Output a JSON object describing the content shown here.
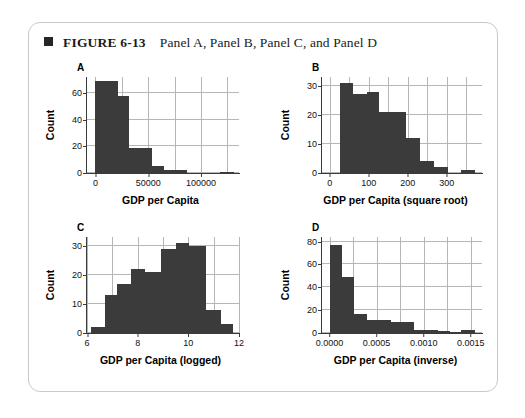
{
  "figure": {
    "bullet_icon": "square-bullet-icon",
    "label": "FIGURE 6-13",
    "caption": "Panel A, Panel B, Panel C, and Panel D"
  },
  "colors": {
    "bar": "#3b3b3b",
    "grid": "#b6b6b6",
    "axis": "#3a3a3a",
    "card_border": "#c9c9c9",
    "text": "#111111"
  },
  "chart_data": [
    {
      "panel": "A",
      "type": "bar",
      "title": "A",
      "xlabel": "GDP per Capita",
      "ylabel": "Count",
      "xlim": [
        -8000,
        136000
      ],
      "ylim": [
        0,
        72
      ],
      "xticks": [
        0,
        50000,
        100000
      ],
      "xticklabels": [
        "0",
        "50000",
        "100000"
      ],
      "yticks": [
        0,
        20,
        40,
        60
      ],
      "yticklabels": [
        "0",
        "20",
        "40",
        "60"
      ],
      "grid": true,
      "bin_edges": [
        0,
        10000,
        21000,
        32000,
        43000,
        54000,
        65000,
        76000,
        87000,
        98000,
        120000,
        131000
      ],
      "values": [
        69,
        69,
        58,
        19,
        19,
        5,
        2,
        2,
        0,
        0,
        1
      ],
      "bars": [
        {
          "x0": 0,
          "x1": 21000,
          "height": 69
        },
        {
          "x0": 21000,
          "x1": 32000,
          "height": 58
        },
        {
          "x0": 32000,
          "x1": 54000,
          "height": 19
        },
        {
          "x0": 54000,
          "x1": 65000,
          "height": 5
        },
        {
          "x0": 65000,
          "x1": 87000,
          "height": 2
        },
        {
          "x0": 118000,
          "x1": 131000,
          "height": 1
        }
      ]
    },
    {
      "panel": "B",
      "type": "bar",
      "title": "B",
      "xlabel": "GDP per Capita (square root)",
      "ylabel": "Count",
      "xlim": [
        -20,
        390
      ],
      "ylim": [
        0,
        33
      ],
      "xticks": [
        0,
        100,
        200,
        300
      ],
      "xticklabels": [
        "0",
        "100",
        "200",
        "300"
      ],
      "yticks": [
        0,
        10,
        20,
        30
      ],
      "yticklabels": [
        "0",
        "10",
        "20",
        "30"
      ],
      "grid": true,
      "bars": [
        {
          "x0": 25,
          "x1": 60,
          "height": 31
        },
        {
          "x0": 60,
          "x1": 95,
          "height": 27
        },
        {
          "x0": 95,
          "x1": 127,
          "height": 28
        },
        {
          "x0": 127,
          "x1": 196,
          "height": 21
        },
        {
          "x0": 196,
          "x1": 232,
          "height": 12
        },
        {
          "x0": 232,
          "x1": 266,
          "height": 4
        },
        {
          "x0": 266,
          "x1": 302,
          "height": 2
        },
        {
          "x0": 336,
          "x1": 371,
          "height": 1
        }
      ]
    },
    {
      "panel": "C",
      "type": "bar",
      "title": "C",
      "xlabel": "GDP per Capita (logged)",
      "ylabel": "Count",
      "xlim": [
        6,
        12
      ],
      "ylim": [
        0,
        33
      ],
      "xticks": [
        6,
        8,
        10,
        12
      ],
      "xticklabels": [
        "6",
        "8",
        "10",
        "12"
      ],
      "yticks": [
        0,
        10,
        20,
        30
      ],
      "yticklabels": [
        "0",
        "10",
        "20",
        "30"
      ],
      "grid": true,
      "bars": [
        {
          "x0": 6.15,
          "x1": 6.72,
          "height": 2
        },
        {
          "x0": 6.72,
          "x1": 7.2,
          "height": 13
        },
        {
          "x0": 7.2,
          "x1": 7.72,
          "height": 17
        },
        {
          "x0": 7.72,
          "x1": 8.3,
          "height": 22
        },
        {
          "x0": 8.3,
          "x1": 8.92,
          "height": 21
        },
        {
          "x0": 8.92,
          "x1": 9.52,
          "height": 29
        },
        {
          "x0": 9.52,
          "x1": 10.02,
          "height": 31
        },
        {
          "x0": 10.02,
          "x1": 10.68,
          "height": 30
        },
        {
          "x0": 10.68,
          "x1": 11.28,
          "height": 8
        },
        {
          "x0": 11.28,
          "x1": 11.78,
          "height": 3
        }
      ]
    },
    {
      "panel": "D",
      "type": "bar",
      "title": "D",
      "xlabel": "GDP per Capita (inverse)",
      "ylabel": "Count",
      "xlim": [
        -8e-05,
        0.00162
      ],
      "ylim": [
        0,
        84
      ],
      "xticks": [
        0.0,
        0.0005,
        0.001,
        0.0015
      ],
      "xticklabels": [
        "0.0000",
        "0.0005",
        "0.0010",
        "0.0015"
      ],
      "yticks": [
        0,
        20,
        40,
        60,
        80
      ],
      "yticklabels": [
        "0",
        "20",
        "40",
        "60",
        "80"
      ],
      "grid": true,
      "bars": [
        {
          "x0": 0.0,
          "x1": 0.00013,
          "height": 77
        },
        {
          "x0": 0.00013,
          "x1": 0.00026,
          "height": 49
        },
        {
          "x0": 0.00026,
          "x1": 0.0004,
          "height": 17
        },
        {
          "x0": 0.0004,
          "x1": 0.00065,
          "height": 11
        },
        {
          "x0": 0.00065,
          "x1": 0.00073,
          "height": 10
        },
        {
          "x0": 0.00073,
          "x1": 0.0009,
          "height": 10
        },
        {
          "x0": 0.0009,
          "x1": 0.00115,
          "height": 3
        },
        {
          "x0": 0.00115,
          "x1": 0.00128,
          "height": 2
        },
        {
          "x0": 0.00128,
          "x1": 0.0014,
          "height": 1
        },
        {
          "x0": 0.0014,
          "x1": 0.00155,
          "height": 3
        }
      ]
    }
  ]
}
